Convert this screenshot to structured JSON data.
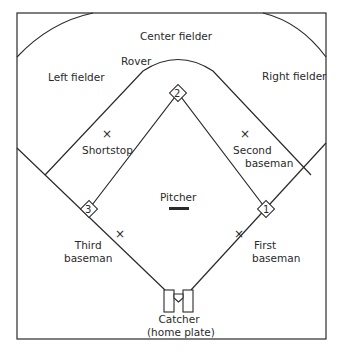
{
  "colors": {
    "line": "#2a2a2a",
    "background": "#ffffff"
  },
  "positions": {
    "center_fielder": "Center fielder",
    "left_fielder": "Left fielder",
    "right_fielder": "Right fielder",
    "rover": "Rover",
    "shortstop": "Shortstop",
    "second_baseman_line1": "Second",
    "second_baseman_line2": "baseman",
    "pitcher": "Pitcher",
    "third_baseman_line1": "Third",
    "third_baseman_line2": "baseman",
    "first_baseman_line1": "First",
    "first_baseman_line2": "baseman",
    "catcher_line1": "Catcher",
    "catcher_line2": "(home plate)"
  },
  "bases": {
    "first": "1",
    "second": "2",
    "third": "3"
  },
  "marker_glyph": "×"
}
